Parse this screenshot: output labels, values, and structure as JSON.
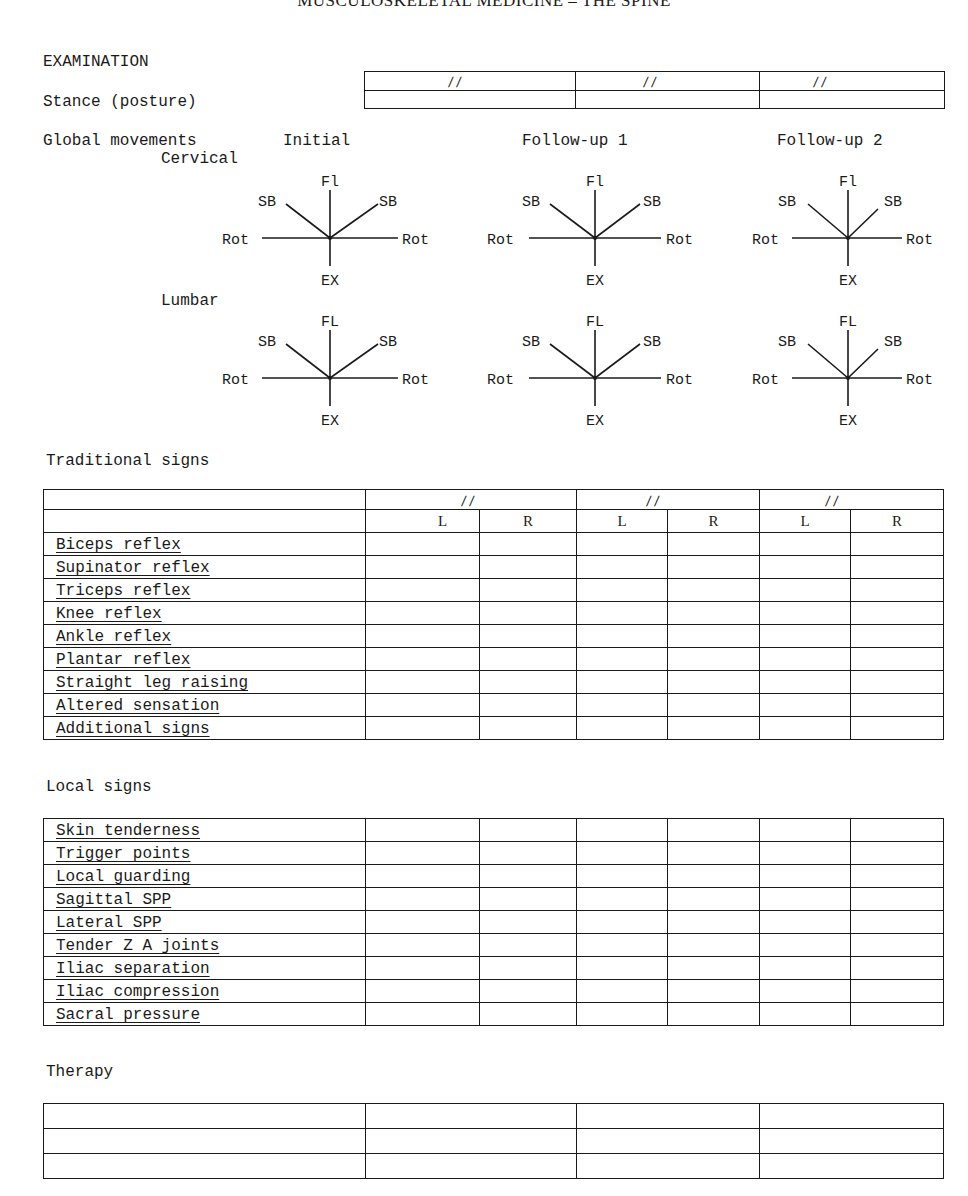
{
  "header": {
    "title": "MUSCULOSKELETAL MEDICINE – THE SPINE"
  },
  "examination": {
    "title": "EXAMINATION",
    "stance_label": "Stance (posture)",
    "date_placeholder": "/   /"
  },
  "global_movements": {
    "label": "Global movements",
    "columns": [
      "Initial",
      "Follow-up 1",
      "Follow-up 2"
    ],
    "cervical": {
      "label": "Cervical",
      "axes": {
        "top": "Fl",
        "bottom": "EX",
        "left_diag": "SB",
        "right_diag": "SB",
        "left": "Rot",
        "right": "Rot"
      }
    },
    "lumbar": {
      "label": "Lumbar",
      "axes": {
        "top": "FL",
        "bottom": "EX",
        "left_diag": "SB",
        "right_diag": "SB",
        "left": "Rot",
        "right": "Rot"
      }
    }
  },
  "traditional_signs": {
    "title": "Traditional signs",
    "date_placeholder": "/   /",
    "side_headers": [
      "L",
      "R",
      "L",
      "R",
      "L",
      "R"
    ],
    "rows": [
      "Biceps reflex",
      "Supinator reflex",
      "Triceps reflex",
      "Knee reflex",
      "Ankle reflex",
      "Plantar reflex",
      "Straight leg raising",
      "Altered sensation",
      "Additional signs"
    ]
  },
  "local_signs": {
    "title": "Local signs",
    "rows": [
      "Skin tenderness",
      "Trigger points",
      "Local guarding",
      "Sagittal SPP",
      "Lateral SPP",
      "Tender Z A joints",
      "Iliac separation",
      "Iliac compression",
      "Sacral pressure"
    ]
  },
  "therapy": {
    "title": "Therapy",
    "row_count": 3
  }
}
